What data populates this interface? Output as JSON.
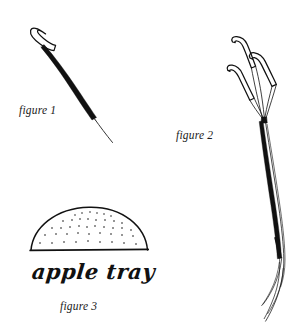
{
  "page": {
    "kind": "patent-line-drawing",
    "background_color": "#ffffff",
    "ink_color": "#111111",
    "width": 303,
    "height": 326
  },
  "figures": [
    {
      "id": "figure-1",
      "label": "figure 1",
      "subject": "hooked-stem",
      "description": "slender tapering stem with an elongated open loop at the upper tip"
    },
    {
      "id": "figure-2",
      "label": "figure 2",
      "subject": "three-pronged-stem",
      "description": "tall slender bundled stem splitting into three outlined hooked prongs at the top"
    },
    {
      "id": "figure-3",
      "label": "figure 3",
      "subject": "apple-tray",
      "caption": "apple tray",
      "description": "shallow dome in cross-section with stippled interior resting on a flat base line"
    }
  ],
  "labels": {
    "figure_1": "figure 1",
    "figure_2": "figure 2",
    "figure_3": "figure 3",
    "apple_tray": "apple tray"
  }
}
